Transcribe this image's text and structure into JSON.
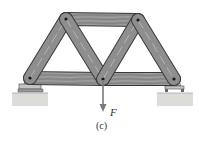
{
  "figure": {
    "caption": "(c)",
    "force_label": "F",
    "colors": {
      "member": "#8e8e8e",
      "member_edge": "#3a3a3a",
      "grain": "#b8b8b8",
      "pin": "#1a1a1a",
      "ground": "#d9d9d6",
      "arrow": "#7a7a7a"
    },
    "joints": [
      {
        "id": "A",
        "x": 30,
        "y": 78
      },
      {
        "id": "B",
        "x": 66,
        "y": 19
      },
      {
        "id": "C",
        "x": 103,
        "y": 79
      },
      {
        "id": "D",
        "x": 138,
        "y": 20
      },
      {
        "id": "E",
        "x": 174,
        "y": 79
      }
    ],
    "members": [
      [
        "A",
        "B"
      ],
      [
        "B",
        "C"
      ],
      [
        "C",
        "D"
      ],
      [
        "D",
        "E"
      ],
      [
        "B",
        "D"
      ],
      [
        "A",
        "C"
      ],
      [
        "C",
        "E"
      ]
    ],
    "supports": {
      "left": "pin",
      "right": "roller"
    },
    "load": {
      "joint": "C",
      "direction": "down"
    }
  }
}
